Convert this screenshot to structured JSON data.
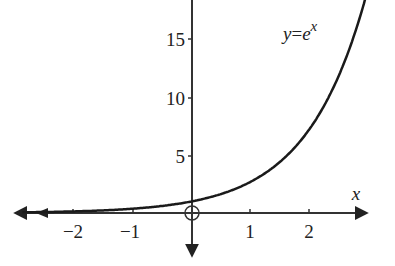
{
  "chart_data": {
    "type": "line",
    "title": "",
    "function_label": "y=e^x",
    "label_y": "y",
    "label_eq": "=",
    "label_base": "e",
    "label_exp": "x",
    "xlabel": "x",
    "ylabel": "",
    "x_ticks": [
      -2,
      -1,
      1,
      2
    ],
    "x_tick_labels": [
      "−2",
      "−1",
      "1",
      "2"
    ],
    "y_ticks": [
      5,
      10,
      15
    ],
    "y_tick_labels": [
      "5",
      "10",
      "15"
    ],
    "xlim": [
      -3,
      3
    ],
    "ylim": [
      -2,
      18
    ],
    "grid": false,
    "origin_marker": "circle",
    "series": [
      {
        "name": "y=e^x",
        "x": [
          -3,
          -2,
          -1,
          0,
          1,
          2,
          2.5,
          2.9
        ],
        "values": [
          0.05,
          0.14,
          0.37,
          1,
          2.72,
          7.39,
          12.18,
          18.17
        ]
      }
    ]
  }
}
